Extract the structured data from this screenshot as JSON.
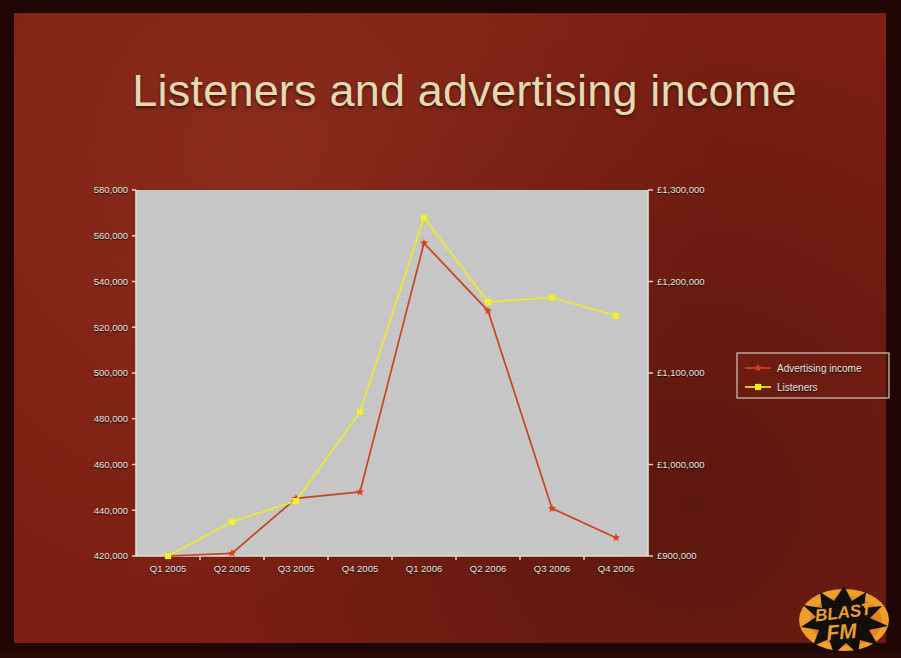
{
  "slide": {
    "title": "Listeners and advertising income",
    "background_color": "#7d1d10",
    "title_color": "#e8dcb4",
    "border_color": "#210704"
  },
  "logo": {
    "name": "blast-fm-logo",
    "line1": "BLAST",
    "line2": "FM",
    "ellipse_color": "#f0a02a",
    "text_color": "#100c08"
  },
  "chart_data": {
    "type": "line",
    "title": "Listeners and advertising income",
    "xlabel": "",
    "ylabel": "Listeners",
    "y2label": "Advertising income",
    "grid": false,
    "legend_position": "right",
    "plot_background": "#c9c9c9",
    "categories": [
      "Q1 2005",
      "Q2 2005",
      "Q3 2005",
      "Q4 2005",
      "Q1 2006",
      "Q2 2006",
      "Q3 2006",
      "Q4 2006"
    ],
    "left_axis": {
      "label": "Listeners",
      "ylim": [
        420000,
        580000
      ],
      "tick_step": 20000,
      "ticks": [
        "420,000",
        "440,000",
        "460,000",
        "480,000",
        "500,000",
        "520,000",
        "540,000",
        "560,000",
        "580,000"
      ],
      "tick_values": [
        420000,
        440000,
        460000,
        480000,
        500000,
        520000,
        540000,
        560000,
        580000
      ]
    },
    "right_axis": {
      "label": "Advertising income",
      "ylim": [
        900000,
        1300000
      ],
      "tick_step": 100000,
      "ticks": [
        "£900,000",
        "£1,000,000",
        "£1,100,000",
        "£1,200,000",
        "£1,300,000"
      ],
      "tick_values": [
        900000,
        1000000,
        1100000,
        1200000,
        1300000
      ]
    },
    "series": [
      {
        "name": "Advertising income",
        "axis": "right",
        "color": "#c8441d",
        "marker": "star",
        "unit": "GBP",
        "values": [
          900000,
          903000,
          963000,
          970000,
          1242000,
          1168000,
          952000,
          920000
        ]
      },
      {
        "name": "Listeners",
        "axis": "left",
        "color": "#f2f025",
        "marker": "square",
        "unit": "listeners",
        "values": [
          420000,
          435000,
          444000,
          483000,
          568000,
          531000,
          533000,
          525000
        ]
      }
    ],
    "legend": [
      {
        "label": "Advertising income",
        "color": "#c8441d",
        "marker": "star"
      },
      {
        "label": "Listeners",
        "color": "#f2f025",
        "marker": "square"
      }
    ]
  }
}
